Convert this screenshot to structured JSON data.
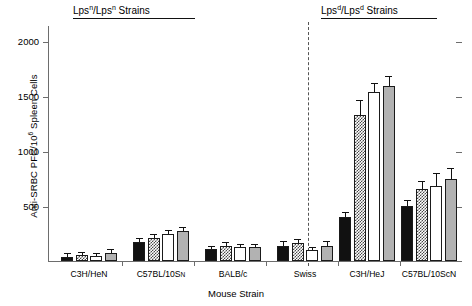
{
  "chart_data": {
    "type": "bar",
    "title": "",
    "xlabel": "Mouse Strain",
    "ylabel": "Anti-SRBC PFC/10⁶ Spleen Cells",
    "ylim": [
      0,
      2150
    ],
    "yticks": [
      500,
      1000,
      1500,
      2000
    ],
    "ytick_labels": [
      "500",
      "1000",
      "1500",
      "2000"
    ],
    "grid": false,
    "legend_position": "none",
    "categories": [
      "C3H/HeN",
      "C57BL/10SN",
      "BALB/c",
      "Swiss",
      "C3H/HeJ",
      "C57BL/10ScN"
    ],
    "series": [
      {
        "name": "bar-1",
        "fill": "black",
        "values": [
          40,
          175,
          105,
          140,
          400,
          505
        ],
        "errors": [
          20,
          25,
          25,
          30,
          35,
          45
        ]
      },
      {
        "name": "bar-2",
        "fill": "hatched",
        "values": [
          55,
          210,
          135,
          160,
          1330,
          655
        ],
        "errors": [
          20,
          30,
          30,
          30,
          130,
          65
        ]
      },
      {
        "name": "bar-3",
        "fill": "white",
        "values": [
          50,
          245,
          125,
          100,
          1540,
          680
        ],
        "errors": [
          18,
          28,
          25,
          20,
          75,
          110
        ]
      },
      {
        "name": "bar-4",
        "fill": "gray",
        "values": [
          75,
          275,
          125,
          140,
          1590,
          745
        ],
        "errors": [
          25,
          30,
          25,
          30,
          90,
          95
        ]
      }
    ],
    "annotations": [
      {
        "id": "left-group-header",
        "text_before": "Lps",
        "sup1": "n",
        "middle": "/Lps",
        "sup2": "n",
        "text_after": " Strains",
        "underline": true
      },
      {
        "id": "right-group-header",
        "text_before": "Lps",
        "sup1": "d",
        "middle": "/Lps",
        "sup2": "d",
        "text_after": " Strains",
        "underline": true
      }
    ],
    "divider": {
      "type": "dashed-vertical",
      "between": [
        "Swiss",
        "C3H/HeJ"
      ]
    }
  },
  "axis": {
    "ylabel_main": "Anti-SRBC PFC/10",
    "ylabel_sup": "6",
    "ylabel_tail": " Spleen Cells",
    "xlabel": "Mouse Strain"
  },
  "colors": {
    "bar_black": "#111111",
    "bar_white": "#ffffff",
    "bar_gray": "#b2b2b2",
    "hatch_ink": "#4a4a4a",
    "axis": "#6d6d6d",
    "outline": "#1a1a1a"
  }
}
